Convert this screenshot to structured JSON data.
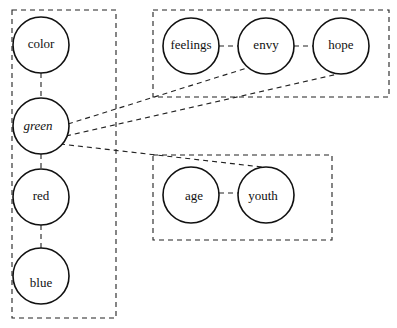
{
  "diagram": {
    "groups": [
      {
        "id": "left-group",
        "x": 12,
        "y": 10,
        "w": 104,
        "h": 308
      },
      {
        "id": "top-group",
        "x": 153,
        "y": 10,
        "w": 236,
        "h": 87
      },
      {
        "id": "bottom-group",
        "x": 153,
        "y": 155,
        "w": 179,
        "h": 85
      }
    ],
    "nodes": [
      {
        "id": "color",
        "label": "color",
        "cx": 41,
        "cy": 45,
        "r": 28,
        "italic": false
      },
      {
        "id": "green",
        "label": "green",
        "cx": 41,
        "cy": 126,
        "r": 28,
        "italic": true
      },
      {
        "id": "red",
        "label": "red",
        "cx": 41,
        "cy": 197,
        "r": 28,
        "italic": false
      },
      {
        "id": "blue",
        "label": "blue",
        "cx": 41,
        "cy": 276,
        "r": 28,
        "italic": false
      },
      {
        "id": "feelings",
        "label": "feelings",
        "cx": 191,
        "cy": 46,
        "r": 28,
        "italic": false
      },
      {
        "id": "envy",
        "label": "envy",
        "cx": 266,
        "cy": 46,
        "r": 28,
        "italic": false
      },
      {
        "id": "hope",
        "label": "hope",
        "cx": 341,
        "cy": 46,
        "r": 28,
        "italic": false
      },
      {
        "id": "age",
        "label": "age",
        "cx": 191,
        "cy": 195,
        "r": 28,
        "italic": false
      },
      {
        "id": "youth",
        "label": "youth",
        "cx": 266,
        "cy": 195,
        "r": 28,
        "italic": false
      }
    ],
    "edges": [
      {
        "from": "color",
        "to": "green"
      },
      {
        "from": "green",
        "to": "red"
      },
      {
        "from": "red",
        "to": "blue"
      },
      {
        "from": "feelings",
        "to": "envy"
      },
      {
        "from": "envy",
        "to": "hope"
      },
      {
        "from": "age",
        "to": "youth"
      },
      {
        "from": "green",
        "to": "envy"
      },
      {
        "from": "green",
        "to": "hope"
      },
      {
        "from": "green",
        "to": "youth"
      }
    ]
  }
}
